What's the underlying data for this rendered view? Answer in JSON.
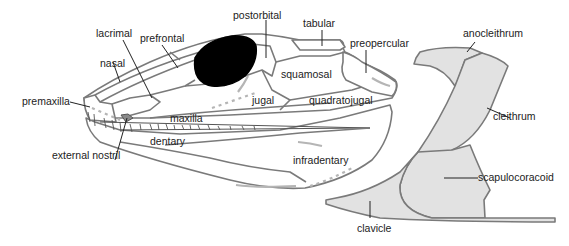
{
  "figure": {
    "colors": {
      "outline": "#7a7a7a",
      "bone_fill": "#ffffff",
      "girdle_fill": "#e2e2e2",
      "orbit": "#000000",
      "nostril": "#8a8a8a",
      "leader": "#222222",
      "sensory_canal": "#b5b5b5"
    }
  },
  "skull": {
    "labels": {
      "lacrimal": "lacrimal",
      "prefrontal": "prefrontal",
      "postorbital": "postorbital",
      "tabular": "tabular",
      "preopercular": "preopercular",
      "nasal": "nasal",
      "premaxilla": "premaxilla",
      "squamosal": "squamosal",
      "jugal": "jugal",
      "quadratojugal": "quadratojugal",
      "maxilla": "maxilla",
      "dentary": "dentary",
      "external_nostril": "external nostril",
      "infradentary": "infradentary"
    }
  },
  "shoulder_girdle": {
    "labels": {
      "anocleithrum": "anocleithrum",
      "cleithrum": "cleithrum",
      "scapulocoracoid": "scapulocoracoid",
      "clavicle": "clavicle"
    }
  }
}
